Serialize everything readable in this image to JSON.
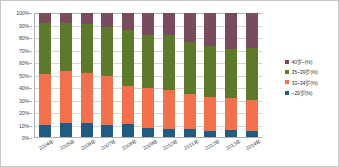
{
  "chart_data": {
    "type": "bar",
    "subtype": "100% stacked column",
    "title": "",
    "xlabel": "",
    "ylabel": "",
    "ylim": [
      0,
      100
    ],
    "y_unit": "%",
    "grid": true,
    "legend_position": "right",
    "categories": [
      "2004年",
      "2005年",
      "2006年",
      "2007年",
      "2008年",
      "2009年",
      "2010年",
      "2011年",
      "2012年",
      "2013年",
      "2014年"
    ],
    "y_ticks": [
      "0%",
      "10%",
      "20%",
      "30%",
      "40%",
      "50%",
      "60%",
      "70%",
      "80%",
      "90%",
      "100%"
    ],
    "series": [
      {
        "name": "~29岁(%)",
        "color": "#1f5c82",
        "values": [
          9.5,
          11.5,
          11.0,
          10.0,
          10.5,
          7.5,
          6.5,
          6.5,
          5.0,
          5.5,
          4.5
        ]
      },
      {
        "name": "30~34岁(%)",
        "color": "#f4704a",
        "values": [
          41.5,
          42.0,
          41.0,
          39.0,
          30.5,
          32.0,
          31.5,
          28.0,
          27.5,
          26.0,
          25.5
        ]
      },
      {
        "name": "35~39岁(%)",
        "color": "#5c7a2a",
        "values": [
          41.0,
          38.5,
          39.0,
          40.0,
          45.0,
          42.5,
          44.0,
          42.0,
          41.0,
          39.5,
          42.0
        ]
      },
      {
        "name": "40岁~(%)",
        "color": "#7a4a5e",
        "values": [
          8.0,
          8.0,
          9.0,
          11.0,
          14.0,
          18.0,
          18.0,
          23.5,
          26.5,
          29.0,
          28.0
        ]
      }
    ]
  },
  "legend": {
    "items": [
      {
        "label": "40岁~(%)",
        "color": "#7a4a5e",
        "swatch_name": "legend-swatch-40plus"
      },
      {
        "label": "35~39岁(%)",
        "color": "#5c7a2a",
        "swatch_name": "legend-swatch-35-39"
      },
      {
        "label": "30~34岁(%)",
        "color": "#f4704a",
        "swatch_name": "legend-swatch-30-34"
      },
      {
        "label": "~29岁(%)",
        "color": "#1f5c82",
        "swatch_name": "legend-swatch-29under"
      }
    ]
  }
}
